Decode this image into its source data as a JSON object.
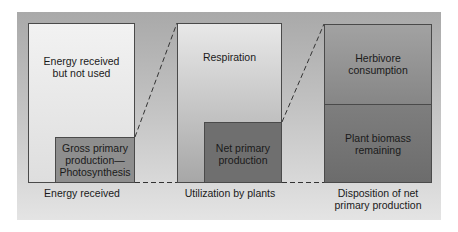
{
  "diagram": {
    "type": "energy-flow-bar-comparison",
    "columns": [
      {
        "caption": "Energy received",
        "outer": {
          "label_line1": "Energy received",
          "label_line2": "but not used"
        },
        "inner": {
          "label_line1": "Gross primary",
          "label_line2": "production—",
          "label_line3": "Photosynthesis"
        }
      },
      {
        "caption": "Utilization by plants",
        "outer": {
          "label_line1": "Respiration"
        },
        "inner": {
          "label_line1": "Net primary",
          "label_line2": "production"
        }
      },
      {
        "caption_line1": "Disposition of net",
        "caption_line2": "primary production",
        "top": {
          "label_line1": "Herbivore",
          "label_line2": "consumption"
        },
        "bottom": {
          "label_line1": "Plant biomass",
          "label_line2": "remaining"
        }
      }
    ],
    "colors": {
      "light_box": "#e9e9e9",
      "mid_box": "#8a8a8a",
      "dark_box": "#6f6f6f",
      "border": "#4a4a4a",
      "background_top": "#a9a9a9",
      "background_bottom": "#e4e4e4"
    }
  }
}
